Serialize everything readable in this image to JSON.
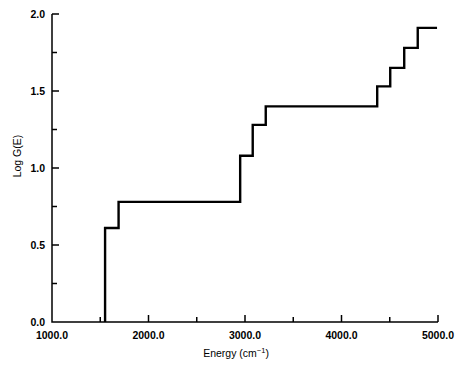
{
  "chart_data": {
    "type": "line",
    "subtype": "step-post",
    "title": "",
    "xlabel": "Energy (cm−1)",
    "xlabel_text": "Energy (cm",
    "xlabel_unit_sup": "−1",
    "xlabel_close": ")",
    "ylabel": "Log G(E)",
    "xlim": [
      1000.0,
      5000.0
    ],
    "ylim": [
      0.0,
      2.0
    ],
    "grid": false,
    "legend": null,
    "xticks": [
      1000.0,
      2000.0,
      3000.0,
      4000.0,
      5000.0
    ],
    "xtick_labels": [
      "1000.0",
      "2000.0",
      "3000.0",
      "4000.0",
      "5000.0"
    ],
    "xminorticks": [
      1500.0,
      2500.0,
      3500.0,
      4500.0
    ],
    "yticks": [
      0.0,
      0.5,
      1.0,
      1.5,
      2.0
    ],
    "ytick_labels": [
      "0.0",
      "0.5",
      "1.0",
      "1.5",
      "2.0"
    ],
    "yminorticks": [
      0.25,
      0.75,
      1.25,
      1.75
    ],
    "line_color": "#000000",
    "line_width": 2.4,
    "axis_color": "#000000",
    "background": "#ffffff",
    "steps": [
      {
        "x": 1550,
        "y": 0.0
      },
      {
        "x": 1550,
        "y": 0.61
      },
      {
        "x": 1690,
        "y": 0.61
      },
      {
        "x": 1690,
        "y": 0.78
      },
      {
        "x": 2950,
        "y": 0.78
      },
      {
        "x": 2950,
        "y": 1.08
      },
      {
        "x": 3080,
        "y": 1.08
      },
      {
        "x": 3080,
        "y": 1.28
      },
      {
        "x": 3215,
        "y": 1.28
      },
      {
        "x": 3215,
        "y": 1.4
      },
      {
        "x": 4370,
        "y": 1.4
      },
      {
        "x": 4370,
        "y": 1.53
      },
      {
        "x": 4505,
        "y": 1.53
      },
      {
        "x": 4505,
        "y": 1.65
      },
      {
        "x": 4650,
        "y": 1.65
      },
      {
        "x": 4650,
        "y": 1.78
      },
      {
        "x": 4790,
        "y": 1.78
      },
      {
        "x": 4790,
        "y": 1.91
      },
      {
        "x": 4990,
        "y": 1.91
      }
    ],
    "step_levels": [
      0.61,
      0.78,
      1.08,
      1.28,
      1.4,
      1.53,
      1.65,
      1.78,
      1.91
    ],
    "step_edges": [
      1550,
      1690,
      2950,
      3080,
      3215,
      4370,
      4505,
      4650,
      4790
    ]
  }
}
